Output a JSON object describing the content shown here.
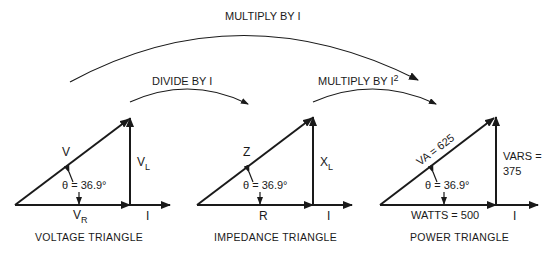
{
  "arrows": {
    "top": "MULTIPLY BY I",
    "left": "DIVIDE BY I",
    "right_prefix": "MULTIPLY BY I",
    "right_superscript": "2"
  },
  "triangles": [
    {
      "caption": "VOLTAGE TRIANGLE",
      "hypotenuse": "V",
      "vertical_main": "V",
      "vertical_sub": "L",
      "horizontal_main": "V",
      "horizontal_sub": "R",
      "axis": "I",
      "angle": "θ = 36.9°"
    },
    {
      "caption": "IMPEDANCE TRIANGLE",
      "hypotenuse": "Z",
      "vertical_main": "X",
      "vertical_sub": "L",
      "horizontal_main": "R",
      "horizontal_sub": "",
      "axis": "I",
      "angle": "θ = 36.9°"
    },
    {
      "caption": "POWER TRIANGLE",
      "hypotenuse": "VA = 625",
      "vertical_line1": "VARS =",
      "vertical_line2": "375",
      "horizontal_main": "WATTS = 500",
      "axis": "I",
      "angle": "θ = 36.9°"
    }
  ]
}
